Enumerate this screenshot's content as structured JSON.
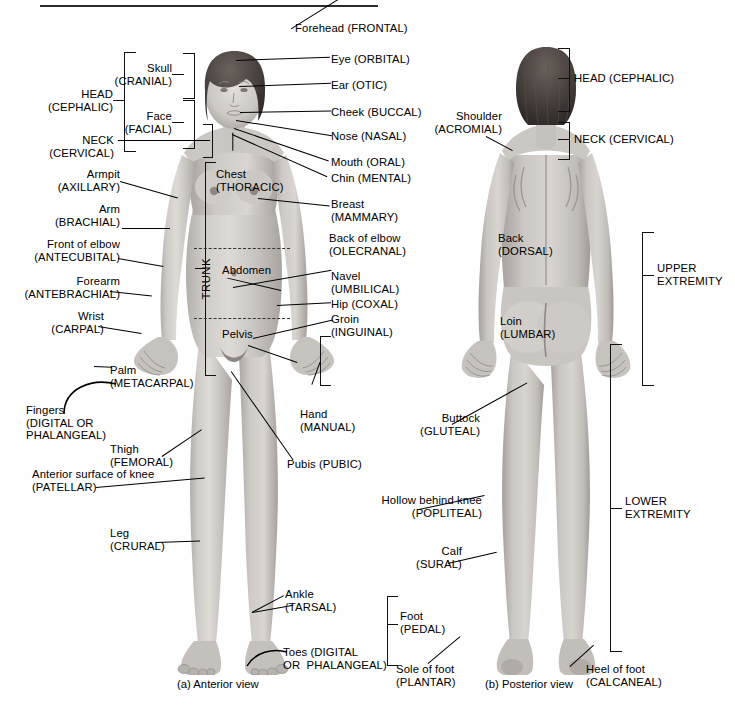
{
  "figure": {
    "title_rule": true,
    "captions": {
      "anterior": "(a) Anterior view",
      "posterior": "(b) Posterior view"
    }
  },
  "anterior": {
    "brackets": [
      {
        "name": "head-cephalic",
        "label": "HEAD\n(CEPHALIC)"
      },
      {
        "name": "skull-cranial",
        "label": "Skull\n(CRANIAL)"
      },
      {
        "name": "face-facial",
        "label": "Face\n(FACIAL)"
      },
      {
        "name": "neck-cervical",
        "label": "NECK\n(CERVICAL)"
      },
      {
        "name": "trunk",
        "label": "TRUNK"
      },
      {
        "name": "hand-manual",
        "label": "Hand\n(MANUAL)"
      },
      {
        "name": "foot-pedal",
        "label": "Foot\n(PEDAL)"
      }
    ],
    "labels_left": [
      {
        "name": "armpit",
        "label": "Armpit\n(AXILLARY)"
      },
      {
        "name": "arm",
        "label": "Arm\n(BRACHIAL)"
      },
      {
        "name": "front-of-elbow",
        "label": "Front of elbow\n(ANTECUBITAL)"
      },
      {
        "name": "forearm",
        "label": "Forearm\n(ANTEBRACHIAL)"
      },
      {
        "name": "wrist",
        "label": "Wrist\n(CARPAL)"
      },
      {
        "name": "palm",
        "label": "Palm\n(METACARPAL)"
      },
      {
        "name": "fingers",
        "label": "Fingers\n(DIGITAL OR\nPHALANGEAL)"
      },
      {
        "name": "thigh",
        "label": "Thigh\n(FEMORAL)"
      },
      {
        "name": "anterior-surface-of-knee",
        "label": "Anterior surface of knee\n(PATELLAR)"
      },
      {
        "name": "leg",
        "label": "Leg\n(CRURAL)"
      }
    ],
    "labels_right": [
      {
        "name": "forehead",
        "label": "Forehead (FRONTAL)"
      },
      {
        "name": "eye",
        "label": "Eye (ORBITAL)"
      },
      {
        "name": "ear",
        "label": "Ear (OTIC)"
      },
      {
        "name": "cheek",
        "label": "Cheek (BUCCAL)"
      },
      {
        "name": "nose",
        "label": "Nose (NASAL)"
      },
      {
        "name": "mouth",
        "label": "Mouth (ORAL)"
      },
      {
        "name": "chin",
        "label": "Chin (MENTAL)"
      },
      {
        "name": "breast",
        "label": "Breast\n(MAMMARY)"
      },
      {
        "name": "back-of-elbow",
        "label": "Back of elbow\n(OLECRANAL)"
      },
      {
        "name": "navel",
        "label": "Navel\n(UMBILICAL)"
      },
      {
        "name": "hip",
        "label": "Hip (COXAL)"
      },
      {
        "name": "groin",
        "label": "Groin\n(INGUINAL)"
      },
      {
        "name": "pubis",
        "label": "Pubis (PUBIC)"
      }
    ],
    "labels_inner": [
      {
        "name": "chest",
        "label": "Chest\n(THORACIC)"
      },
      {
        "name": "abdomen",
        "label": "Abdomen"
      },
      {
        "name": "pelvis",
        "label": "Pelvis"
      }
    ],
    "labels_bottom": [
      {
        "name": "ankle",
        "label": "Ankle\n(TARSAL)"
      },
      {
        "name": "toes",
        "label": "Toes (DIGITAL\nOR  PHALANGEAL)"
      }
    ]
  },
  "posterior": {
    "brackets": [
      {
        "name": "head-cephalic",
        "label": "HEAD (CEPHALIC)"
      },
      {
        "name": "neck-cervical",
        "label": "NECK (CERVICAL)"
      },
      {
        "name": "upper-extremity",
        "label": "UPPER\nEXTREMITY"
      },
      {
        "name": "lower-extremity",
        "label": "LOWER\nEXTREMITY"
      }
    ],
    "labels": [
      {
        "name": "shoulder",
        "label": "Shoulder\n(ACROMIAL)"
      },
      {
        "name": "back",
        "label": "Back\n(DORSAL)"
      },
      {
        "name": "loin",
        "label": "Loin\n(LUMBAR)"
      },
      {
        "name": "buttock",
        "label": "Buttock\n(GLUTEAL)"
      },
      {
        "name": "hollow-behind-knee",
        "label": "Hollow behind knee\n(POPLITEAL)"
      },
      {
        "name": "calf",
        "label": "Calf\n(SURAL)"
      },
      {
        "name": "sole-of-foot",
        "label": "Sole of foot\n(PLANTAR)"
      },
      {
        "name": "heel-of-foot",
        "label": "Heel of foot\n(CALCANEAL)"
      }
    ]
  },
  "colors": {
    "ink": "#000000",
    "rule": "#2b2b2b",
    "skin_light": "#d7d4d0",
    "skin_mid": "#bcb8b4",
    "skin_dark": "#9d9893",
    "hair": "#4a4441",
    "background": "#fefefe"
  }
}
